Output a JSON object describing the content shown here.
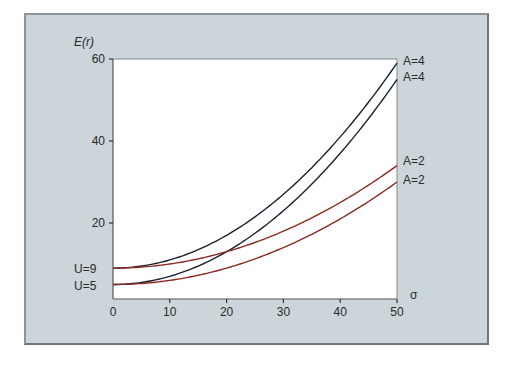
{
  "chart_data": {
    "type": "line",
    "title": "",
    "xlabel": "σ",
    "ylabel": "E(r)",
    "xlim": [
      0,
      50
    ],
    "ylim": [
      1.5,
      60
    ],
    "x_ticks": [
      0,
      10,
      20,
      30,
      40,
      50
    ],
    "y_ticks": [
      20,
      40,
      60
    ],
    "grid": false,
    "legend": "curve end labels",
    "x": [
      0,
      5,
      10,
      15,
      20,
      25,
      30,
      35,
      40,
      45,
      50
    ],
    "series": [
      {
        "name": "U=9, A=4",
        "color": "#1a2230",
        "values": [
          9,
          9.5,
          11,
          13.5,
          17,
          21.5,
          27,
          33.5,
          41,
          49.5,
          59
        ]
      },
      {
        "name": "U=5, A=4",
        "color": "#1a2230",
        "values": [
          5,
          5.5,
          7,
          9.5,
          13,
          17.5,
          23,
          29.5,
          37,
          45.5,
          55
        ]
      },
      {
        "name": "U=9, A=2",
        "color": "#8a2a22",
        "values": [
          9,
          9.25,
          10,
          11.25,
          13,
          15.25,
          18,
          21.25,
          25,
          29.25,
          34
        ]
      },
      {
        "name": "U=5, A=2",
        "color": "#8a2a22",
        "values": [
          5,
          5.25,
          6,
          7.25,
          9,
          11.25,
          14,
          17.25,
          21,
          25.25,
          30
        ]
      }
    ],
    "annotations": [
      "U=9",
      "U=5",
      "A=4",
      "A=4",
      "A=2",
      "A=2"
    ]
  },
  "labels": {
    "y_axis_title": "E(r)",
    "x_axis_title": "σ",
    "y_ticks": [
      "60",
      "40",
      "20"
    ],
    "x_ticks": [
      "0",
      "10",
      "20",
      "30",
      "40",
      "50"
    ],
    "left_curve_labels": [
      "U=9",
      "U=5"
    ],
    "right_curve_labels": [
      "A=4",
      "A=4",
      "A=2",
      "A=2"
    ]
  }
}
